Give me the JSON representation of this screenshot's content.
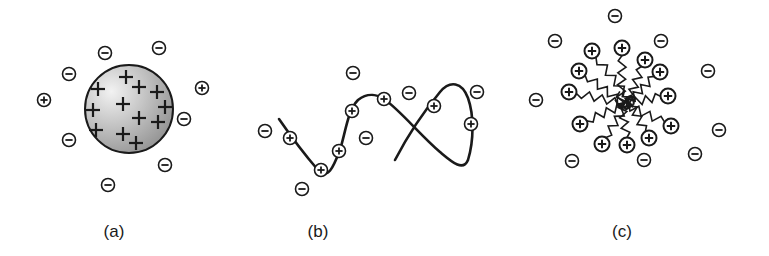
{
  "figure": {
    "colors": {
      "stroke": "#1a1a1a",
      "sphere_light": "#f2f2f2",
      "sphere_dark": "#8c8c8c",
      "background": "#ffffff"
    },
    "panels": [
      {
        "id": "a",
        "label": "(a)",
        "label_x": 114,
        "type": "charged-sphere",
        "sphere": {
          "cx": 129,
          "cy": 109,
          "r": 44
        },
        "inner_charges": [
          {
            "x": 126,
            "y": 77
          },
          {
            "x": 139,
            "y": 87
          },
          {
            "x": 98,
            "y": 89
          },
          {
            "x": 157,
            "y": 92
          },
          {
            "x": 123,
            "y": 104
          },
          {
            "x": 93,
            "y": 110
          },
          {
            "x": 165,
            "y": 107
          },
          {
            "x": 139,
            "y": 118
          },
          {
            "x": 158,
            "y": 122
          },
          {
            "x": 96,
            "y": 130
          },
          {
            "x": 123,
            "y": 134
          },
          {
            "x": 136,
            "y": 143
          }
        ],
        "ions": [
          {
            "sign": "-",
            "x": 105,
            "y": 53
          },
          {
            "sign": "-",
            "x": 159,
            "y": 48
          },
          {
            "sign": "-",
            "x": 69,
            "y": 74
          },
          {
            "sign": "+",
            "x": 44,
            "y": 100
          },
          {
            "sign": "+",
            "x": 202,
            "y": 88
          },
          {
            "sign": "-",
            "x": 184,
            "y": 119
          },
          {
            "sign": "-",
            "x": 69,
            "y": 140
          },
          {
            "sign": "-",
            "x": 165,
            "y": 165
          },
          {
            "sign": "-",
            "x": 108,
            "y": 185
          }
        ]
      },
      {
        "id": "b",
        "label": "(b)",
        "label_x": 318,
        "type": "charged-chain",
        "chain_path": "M279,119 C290,135 305,155 318,170 C328,180 333,168 340,150 C346,130 348,110 358,100 C368,92 378,95 384,99 C400,110 420,135 440,152 C452,162 463,172 468,160 C474,140 474,115 468,98 C462,82 450,80 440,92 C425,110 408,135 395,160",
        "ions": [
          {
            "sign": "+",
            "x": 290,
            "y": 138
          },
          {
            "sign": "+",
            "x": 321,
            "y": 170
          },
          {
            "sign": "+",
            "x": 339,
            "y": 151
          },
          {
            "sign": "+",
            "x": 352,
            "y": 111
          },
          {
            "sign": "+",
            "x": 384,
            "y": 99
          },
          {
            "sign": "+",
            "x": 434,
            "y": 106
          },
          {
            "sign": "+",
            "x": 471,
            "y": 124
          },
          {
            "sign": "-",
            "x": 265,
            "y": 131
          },
          {
            "sign": "-",
            "x": 302,
            "y": 189
          },
          {
            "sign": "-",
            "x": 366,
            "y": 138
          },
          {
            "sign": "-",
            "x": 353,
            "y": 73
          },
          {
            "sign": "-",
            "x": 409,
            "y": 93
          },
          {
            "sign": "-",
            "x": 477,
            "y": 92
          }
        ]
      },
      {
        "id": "c",
        "label": "(c)",
        "label_x": 622,
        "type": "charged-micelle",
        "center": {
          "x": 625,
          "y": 100
        },
        "head_groups": [
          {
            "x": 592,
            "y": 51
          },
          {
            "x": 622,
            "y": 48
          },
          {
            "x": 645,
            "y": 60
          },
          {
            "x": 579,
            "y": 71
          },
          {
            "x": 660,
            "y": 72
          },
          {
            "x": 569,
            "y": 92
          },
          {
            "x": 668,
            "y": 96
          },
          {
            "x": 580,
            "y": 124
          },
          {
            "x": 671,
            "y": 126
          },
          {
            "x": 602,
            "y": 144
          },
          {
            "x": 627,
            "y": 145
          },
          {
            "x": 649,
            "y": 138
          }
        ],
        "ions": [
          {
            "sign": "-",
            "x": 615,
            "y": 16
          },
          {
            "sign": "-",
            "x": 555,
            "y": 41
          },
          {
            "sign": "-",
            "x": 661,
            "y": 41
          },
          {
            "sign": "-",
            "x": 708,
            "y": 71
          },
          {
            "sign": "-",
            "x": 536,
            "y": 100
          },
          {
            "sign": "-",
            "x": 719,
            "y": 130
          },
          {
            "sign": "-",
            "x": 695,
            "y": 154
          },
          {
            "sign": "-",
            "x": 572,
            "y": 161
          },
          {
            "sign": "-",
            "x": 644,
            "y": 160
          }
        ]
      }
    ]
  }
}
